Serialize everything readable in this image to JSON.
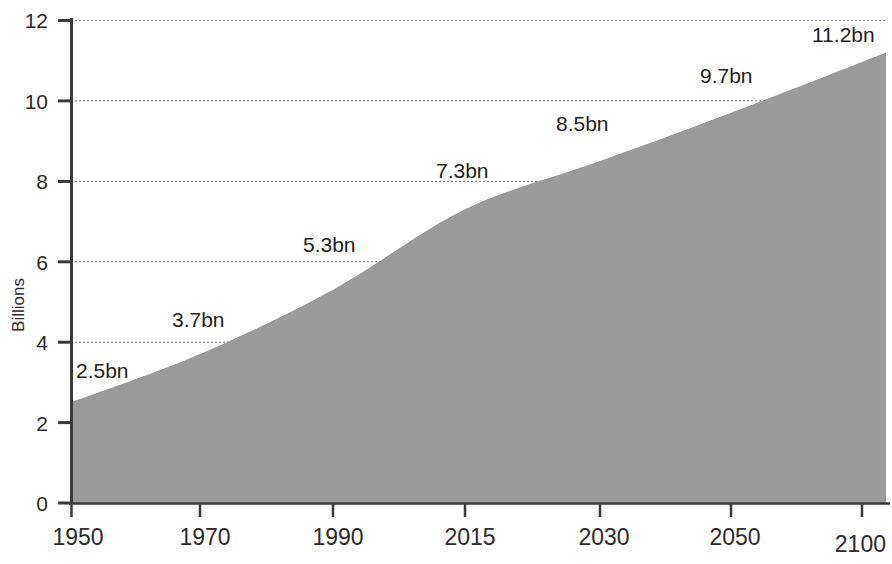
{
  "chart_data": {
    "type": "area",
    "title": "",
    "xlabel": "",
    "ylabel": "Billions",
    "ylim": [
      0,
      12
    ],
    "y_ticks": [
      "0",
      "2",
      "4",
      "6",
      "8",
      "10",
      "12"
    ],
    "y_tick_values": [
      0,
      2,
      4,
      6,
      8,
      10,
      12
    ],
    "grid": true,
    "legend": "none",
    "x_ticks": [
      "1950",
      "1970",
      "1990",
      "2015",
      "2030",
      "2050",
      "2100"
    ],
    "x": [
      1950,
      1970,
      1990,
      2015,
      2030,
      2050,
      2100
    ],
    "values": [
      2.5,
      3.7,
      5.3,
      7.3,
      8.5,
      9.7,
      11.2
    ],
    "point_labels": [
      "2.5bn",
      "3.7bn",
      "5.3bn",
      "7.3bn",
      "8.5bn",
      "9.7bn",
      "11.2bn"
    ],
    "series": [
      {
        "name": "World population",
        "values": [
          2.5,
          3.7,
          5.3,
          7.3,
          8.5,
          9.7,
          11.2
        ]
      }
    ],
    "colors": {
      "area_fill": "#9a9a9a",
      "axis": "#3a3a3a",
      "grid": "#6f6f6f",
      "text": "#2b2b2b"
    }
  },
  "axes": {
    "y_title": "Billions"
  }
}
